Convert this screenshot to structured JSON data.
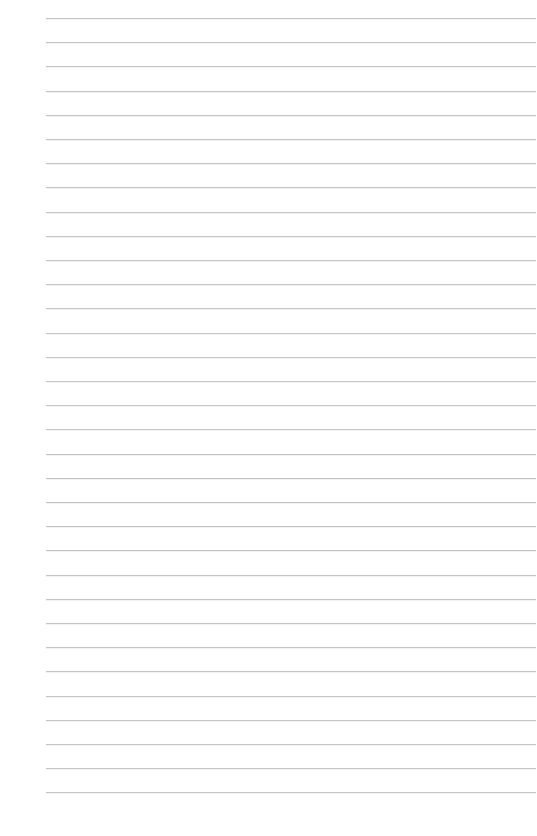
{
  "page": {
    "type": "lined-paper",
    "background_color": "#ffffff",
    "line_color": "#c6c6c6",
    "line_count": 33,
    "first_line_y": 18,
    "line_spacing": 24.2,
    "line_left": 46,
    "line_right": 536,
    "text": ""
  }
}
